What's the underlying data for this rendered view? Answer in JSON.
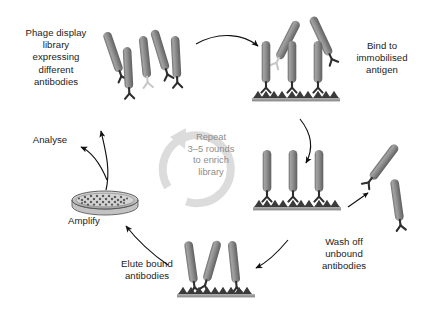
{
  "figure": {
    "background_color": "#ffffff",
    "text_color": "#1b1b1b",
    "muted_text_color": "#8e8e8e",
    "phage_body_color": "#8a8a8a",
    "phage_body_dark": "#5e5e5e",
    "phage_body_light": "#b5b5b5",
    "antibody_color": "#2e2e2e",
    "antibody_light_color": "#c8c8c8",
    "antigen_color": "#3a3a3a",
    "surface_bar_color": "#9a9a9a",
    "arrow_color": "#111111",
    "repeat_ring_color": "#dcdcdc"
  },
  "labels": {
    "phage_library": "Phage display\nlibrary\nexpressing\ndifferent\nantibodies",
    "bind_antigen": "Bind to\nimmobilised\nantigen",
    "wash_off": "Wash off\nunbound\nantibodies",
    "elute_bound": "Elute bound\nantibodies",
    "amplify": "Amplify",
    "analyse": "Analyse",
    "repeat_center": "Repeat\n3–5 rounds\nto enrich\nlibrary"
  },
  "steps": [
    {
      "id": "library",
      "label": "Phage display library expressing different antibodies",
      "order": 1
    },
    {
      "id": "bind",
      "label": "Bind to immobilised antigen",
      "order": 2
    },
    {
      "id": "wash",
      "label": "Wash off unbound antibodies",
      "order": 3
    },
    {
      "id": "elute",
      "label": "Elute bound antibodies",
      "order": 4
    },
    {
      "id": "amplify",
      "label": "Amplify",
      "order": 5
    },
    {
      "id": "analyse",
      "label": "Analyse",
      "order": 6
    }
  ],
  "repeat_cycle": {
    "rounds": "3–5",
    "purpose": "to enrich library"
  },
  "scene": {
    "library_phages": [
      {
        "x": 113,
        "y": 52,
        "angle": -19,
        "antibody": "dark"
      },
      {
        "x": 127,
        "y": 66,
        "angle": -4,
        "antibody": "dark"
      },
      {
        "x": 143,
        "y": 57,
        "angle": -6,
        "antibody": "light"
      },
      {
        "x": 157,
        "y": 50,
        "angle": -16,
        "antibody": "dark"
      },
      {
        "x": 173,
        "y": 57,
        "angle": -4,
        "antibody": "dark"
      }
    ],
    "bind_surface": {
      "x": 257,
      "y": 101,
      "width": 79,
      "antigen_count": 10
    },
    "bind_bound_phages": [
      {
        "x": 266,
        "y": 62,
        "angle": 0
      },
      {
        "x": 292,
        "y": 62,
        "angle": 0
      },
      {
        "x": 318,
        "y": 62,
        "angle": 0
      }
    ],
    "bind_free_phages": [
      {
        "x": 286,
        "y": 38,
        "angle": 28
      },
      {
        "x": 320,
        "y": 34,
        "angle": -24
      }
    ],
    "wash_surface": {
      "x": 258,
      "y": 206,
      "width": 79,
      "antigen_count": 10
    },
    "wash_bound_phages": [
      {
        "x": 267,
        "y": 171,
        "angle": 0
      },
      {
        "x": 293,
        "y": 171,
        "angle": 0
      },
      {
        "x": 319,
        "y": 171,
        "angle": 0
      }
    ],
    "wash_removed_phages": [
      {
        "x": 383,
        "y": 162,
        "angle": 36
      },
      {
        "x": 396,
        "y": 198,
        "angle": -8
      }
    ],
    "elute_surface": {
      "x": 178,
      "y": 292,
      "width": 72,
      "antigen_count": 9
    },
    "elute_phages": [
      {
        "x": 190,
        "y": 262,
        "angle": -8
      },
      {
        "x": 210,
        "y": 261,
        "angle": 16
      },
      {
        "x": 232,
        "y": 262,
        "angle": -6
      }
    ],
    "petri_dish": {
      "cx": 105,
      "cy": 200,
      "rx": 33,
      "ry": 9,
      "depth": 7,
      "colony_count": 46
    }
  },
  "arrows": [
    {
      "id": "library-to-bind",
      "from": "library",
      "to": "bind"
    },
    {
      "id": "bind-to-wash",
      "from": "bind",
      "to": "wash"
    },
    {
      "id": "wash-to-free",
      "from": "wash",
      "to": "washed-away-phages"
    },
    {
      "id": "wash-to-elute",
      "from": "wash",
      "to": "elute"
    },
    {
      "id": "elute-to-amplify",
      "from": "elute",
      "to": "amplify"
    },
    {
      "id": "amplify-to-library",
      "from": "amplify",
      "to": "library"
    },
    {
      "id": "amplify-to-analyse",
      "from": "amplify",
      "to": "analyse"
    }
  ]
}
